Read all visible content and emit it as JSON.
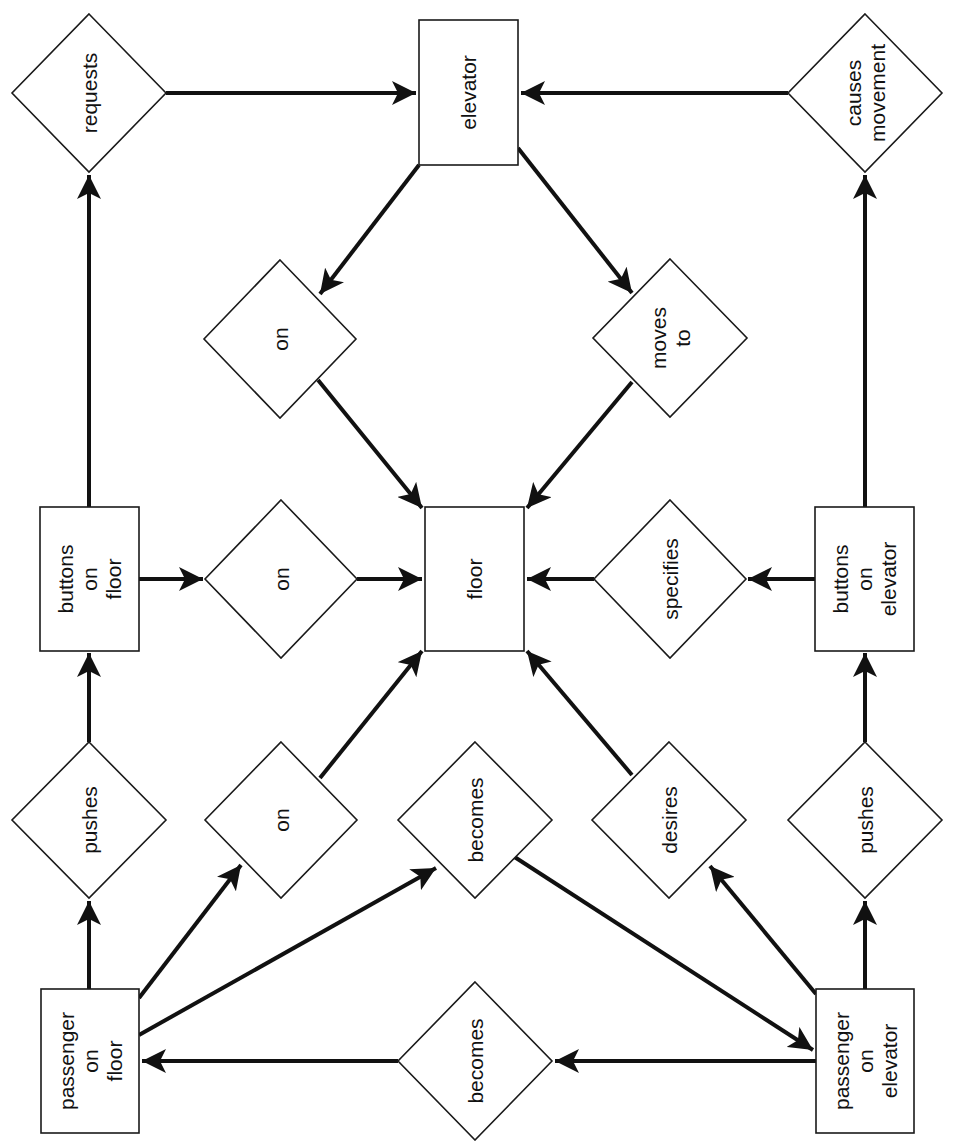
{
  "diagram": {
    "type": "entity-relationship",
    "text_rotation": -90,
    "colors": {
      "stroke": "#111111",
      "fill": "#ffffff",
      "background": "#ffffff"
    },
    "entities": [
      {
        "id": "elevator",
        "lines": [
          "elevator"
        ],
        "x": 419,
        "y": 20,
        "w": 99,
        "h": 145
      },
      {
        "id": "floor",
        "lines": [
          "floor"
        ],
        "x": 425,
        "y": 507,
        "w": 99,
        "h": 144
      },
      {
        "id": "buttons_on_floor",
        "lines": [
          "buttons",
          "on",
          "floor"
        ],
        "x": 40,
        "y": 507,
        "w": 99,
        "h": 144
      },
      {
        "id": "buttons_on_elevator",
        "lines": [
          "buttons",
          "on",
          "elevator"
        ],
        "x": 815,
        "y": 507,
        "w": 99,
        "h": 144
      },
      {
        "id": "passenger_on_floor",
        "lines": [
          "passenger",
          "on",
          "floor"
        ],
        "x": 41,
        "y": 989,
        "w": 98,
        "h": 144
      },
      {
        "id": "passenger_on_elevator",
        "lines": [
          "passenger",
          "on",
          "elevator"
        ],
        "x": 816,
        "y": 989,
        "w": 98,
        "h": 144
      }
    ],
    "relationships": [
      {
        "id": "requests",
        "lines": [
          "requests"
        ],
        "cx": 89,
        "cy": 93,
        "hw": 77,
        "hh": 79
      },
      {
        "id": "causes_movement",
        "lines": [
          "causes",
          "movement"
        ],
        "cx": 865,
        "cy": 93,
        "hw": 77,
        "hh": 79
      },
      {
        "id": "on_elevator_floor",
        "lines": [
          "on"
        ],
        "cx": 280,
        "cy": 339,
        "hw": 76,
        "hh": 79
      },
      {
        "id": "moves_to",
        "lines": [
          "moves",
          "to"
        ],
        "cx": 670,
        "cy": 338,
        "hw": 77,
        "hh": 79
      },
      {
        "id": "on_buttons_floor",
        "lines": [
          "on"
        ],
        "cx": 281,
        "cy": 579,
        "hw": 76,
        "hh": 79
      },
      {
        "id": "specifies",
        "lines": [
          "specifies"
        ],
        "cx": 670,
        "cy": 579,
        "hw": 76,
        "hh": 79
      },
      {
        "id": "pushes_floor",
        "lines": [
          "pushes"
        ],
        "cx": 89,
        "cy": 820,
        "hw": 77,
        "hh": 78
      },
      {
        "id": "on_passenger_floor",
        "lines": [
          "on"
        ],
        "cx": 281,
        "cy": 820,
        "hw": 76,
        "hh": 78
      },
      {
        "id": "becomes_to_elevator",
        "lines": [
          "becomes"
        ],
        "cx": 475,
        "cy": 820,
        "hw": 77,
        "hh": 78
      },
      {
        "id": "desires",
        "lines": [
          "desires"
        ],
        "cx": 669,
        "cy": 820,
        "hw": 77,
        "hh": 78
      },
      {
        "id": "pushes_elevator",
        "lines": [
          "pushes"
        ],
        "cx": 865,
        "cy": 820,
        "hw": 77,
        "hh": 78
      },
      {
        "id": "becomes_to_floor",
        "lines": [
          "becomes"
        ],
        "cx": 475,
        "cy": 1061,
        "hw": 77,
        "hh": 79
      }
    ],
    "edges": [
      {
        "from": "requests",
        "to": "elevator",
        "x1": 166,
        "y1": 93,
        "x2": 416,
        "y2": 93,
        "arrow": true
      },
      {
        "from": "causes_movement",
        "to": "elevator",
        "x1": 788,
        "y1": 93,
        "x2": 521,
        "y2": 93,
        "arrow": true
      },
      {
        "from": "buttons_on_floor",
        "to": "requests",
        "x1": 89,
        "y1": 507,
        "x2": 89,
        "y2": 175,
        "arrow": true
      },
      {
        "from": "buttons_on_elevator",
        "to": "causes_movement",
        "x1": 865,
        "y1": 507,
        "x2": 865,
        "y2": 175,
        "arrow": true
      },
      {
        "from": "elevator",
        "to": "on_elevator_floor",
        "x1": 419,
        "y1": 165,
        "x2": 320,
        "y2": 294,
        "arrow": true
      },
      {
        "from": "elevator",
        "to": "moves_to",
        "x1": 518,
        "y1": 148,
        "x2": 632,
        "y2": 293,
        "arrow": true
      },
      {
        "from": "on_elevator_floor",
        "to": "floor",
        "x1": 318,
        "y1": 380,
        "x2": 422,
        "y2": 508,
        "arrow": true
      },
      {
        "from": "moves_to",
        "to": "floor",
        "x1": 632,
        "y1": 382,
        "x2": 527,
        "y2": 508,
        "arrow": true
      },
      {
        "from": "buttons_on_floor",
        "to": "on_buttons_floor",
        "x1": 139,
        "y1": 579,
        "x2": 203,
        "y2": 579,
        "arrow": true
      },
      {
        "from": "on_buttons_floor",
        "to": "floor",
        "x1": 357,
        "y1": 579,
        "x2": 422,
        "y2": 579,
        "arrow": true
      },
      {
        "from": "specifies",
        "to": "floor",
        "x1": 594,
        "y1": 579,
        "x2": 527,
        "y2": 579,
        "arrow": true
      },
      {
        "from": "buttons_on_elevator",
        "to": "specifies",
        "x1": 815,
        "y1": 579,
        "x2": 748,
        "y2": 579,
        "arrow": true
      },
      {
        "from": "pushes_floor",
        "to": "buttons_on_floor",
        "x1": 89,
        "y1": 742,
        "x2": 89,
        "y2": 653,
        "arrow": true
      },
      {
        "from": "pushes_elevator",
        "to": "buttons_on_elevator",
        "x1": 865,
        "y1": 742,
        "x2": 865,
        "y2": 653,
        "arrow": true
      },
      {
        "from": "on_passenger_floor",
        "to": "floor",
        "x1": 320,
        "y1": 778,
        "x2": 422,
        "y2": 651,
        "arrow": true
      },
      {
        "from": "desires",
        "to": "floor",
        "x1": 632,
        "y1": 775,
        "x2": 527,
        "y2": 651,
        "arrow": true
      },
      {
        "from": "passenger_on_floor",
        "to": "pushes_floor",
        "x1": 89,
        "y1": 989,
        "x2": 89,
        "y2": 901,
        "arrow": true
      },
      {
        "from": "passenger_on_elevator",
        "to": "pushes_elevator",
        "x1": 865,
        "y1": 989,
        "x2": 865,
        "y2": 901,
        "arrow": true
      },
      {
        "from": "passenger_on_floor",
        "to": "on_passenger_floor",
        "x1": 139,
        "y1": 998,
        "x2": 241,
        "y2": 865,
        "arrow": true
      },
      {
        "from": "passenger_on_floor",
        "to": "becomes_to_elevator",
        "x1": 139,
        "y1": 1035,
        "x2": 436,
        "y2": 868,
        "arrow": true
      },
      {
        "from": "becomes_to_elevator",
        "to": "passenger_on_elevator",
        "x1": 513,
        "y1": 856,
        "x2": 813,
        "y2": 1050,
        "arrow": true
      },
      {
        "from": "passenger_on_elevator",
        "to": "desires",
        "x1": 816,
        "y1": 994,
        "x2": 710,
        "y2": 866,
        "arrow": true
      },
      {
        "from": "passenger_on_elevator",
        "to": "becomes_to_floor",
        "x1": 816,
        "y1": 1061,
        "x2": 555,
        "y2": 1061,
        "arrow": true
      },
      {
        "from": "becomes_to_floor",
        "to": "passenger_on_floor",
        "x1": 398,
        "y1": 1061,
        "x2": 142,
        "y2": 1061,
        "arrow": true
      }
    ]
  }
}
